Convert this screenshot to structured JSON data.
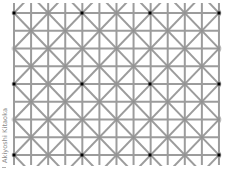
{
  "credit": "Akiyoshi Kitaoka",
  "colors": {
    "background": "#ffffff",
    "line": "#9c9c9c",
    "node": "#8e8e8e",
    "dot": "#000000"
  },
  "grid": {
    "x0": 14,
    "y0": 13,
    "cols": 12,
    "rows": 8,
    "dx": 17.08,
    "dy": 17.75,
    "line_width": 2,
    "extend_top": 10,
    "extend_bottom": 10
  },
  "dots": {
    "count": 12,
    "every_cols": 4,
    "every_rows": 4,
    "size": 3,
    "positions": [
      [
        14,
        13
      ],
      [
        82,
        13
      ],
      [
        150,
        13
      ],
      [
        219,
        13
      ],
      [
        14,
        84
      ],
      [
        82,
        84
      ],
      [
        150,
        84
      ],
      [
        219,
        84
      ],
      [
        14,
        155
      ],
      [
        82,
        155
      ],
      [
        150,
        155
      ],
      [
        219,
        155
      ]
    ]
  }
}
